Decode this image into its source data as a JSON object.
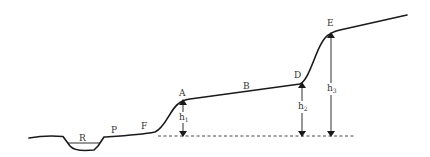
{
  "diagram": {
    "type": "terrace-cross-section",
    "colors": {
      "line": "#1a1a1a",
      "text": "#333333",
      "dashed": "#333333",
      "background": "#ffffff"
    },
    "labels": {
      "R": "R",
      "P": "P",
      "F": "F",
      "A": "A",
      "B": "B",
      "D": "D",
      "E": "E"
    },
    "heights": {
      "h1": {
        "base": "h",
        "sub": "1"
      },
      "h2": {
        "base": "h",
        "sub": "2"
      },
      "h3": {
        "base": "h",
        "sub": "3"
      }
    }
  }
}
